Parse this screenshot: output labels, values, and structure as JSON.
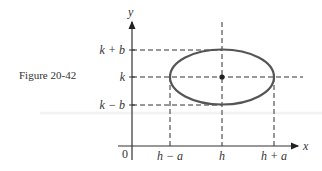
{
  "caption": "Figure 20-42",
  "axes": {
    "x_label": "x",
    "y_label": "y",
    "origin_label": "0"
  },
  "y_ticks": [
    "k + b",
    "k",
    "k − b"
  ],
  "x_ticks": [
    "h − a",
    "h",
    "h + a"
  ],
  "colors": {
    "ink": "#333333",
    "ellipse": "#555555"
  }
}
